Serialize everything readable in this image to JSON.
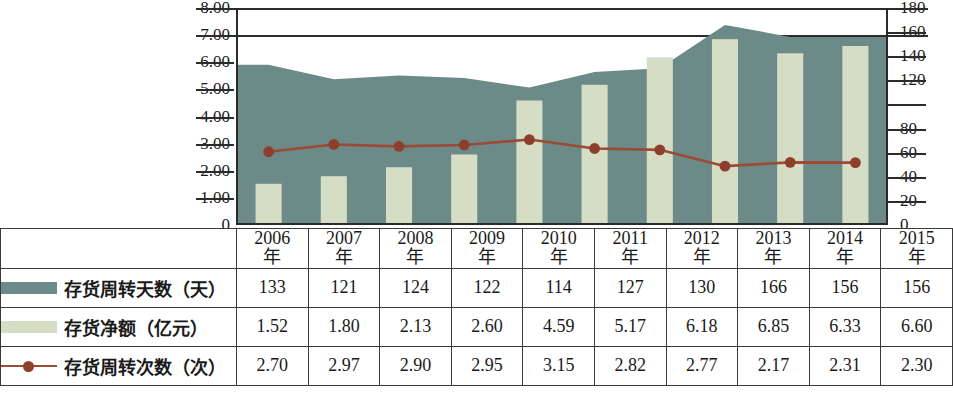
{
  "chart_data": {
    "type": "bar",
    "title": "",
    "subtitle": "",
    "xlabel": "",
    "ylabel": "",
    "grid": true,
    "legend_position": "table-left",
    "categories": [
      "2006年",
      "2007年",
      "2008年",
      "2009年",
      "2010年",
      "2011年",
      "2012年",
      "2013年",
      "2014年",
      "2015年"
    ],
    "x_tick_labels": [
      {
        "year": "2006",
        "suffix": "年"
      },
      {
        "year": "2007",
        "suffix": "年"
      },
      {
        "year": "2008",
        "suffix": "年"
      },
      {
        "year": "2009",
        "suffix": "年"
      },
      {
        "year": "2010",
        "suffix": "年"
      },
      {
        "year": "2011",
        "suffix": "年"
      },
      {
        "year": "2012",
        "suffix": "年"
      },
      {
        "year": "2013",
        "suffix": "年"
      },
      {
        "year": "2014",
        "suffix": "年"
      },
      {
        "year": "2015",
        "suffix": "年"
      }
    ],
    "left_axis": {
      "label": "",
      "ylim": [
        0,
        8
      ],
      "tick_labels": [
        "8.00",
        "7.00",
        "6.00",
        "5.00",
        "4.00",
        "3.00",
        "2.00",
        "1.00",
        "0"
      ],
      "tick_values": [
        8,
        7,
        6,
        5,
        4,
        3,
        2,
        1,
        0
      ]
    },
    "right_axis": {
      "label": "",
      "ylim": [
        0,
        180
      ],
      "tick_labels": [
        "180",
        "160",
        "140",
        "120",
        "80",
        "60",
        "40",
        "20",
        "0"
      ],
      "tick_values": [
        180,
        160,
        140,
        120,
        100,
        80,
        60,
        40,
        20,
        0
      ]
    },
    "series": [
      {
        "name": "存货周转天数（天）",
        "type": "area",
        "axis": "right",
        "unit": "天",
        "color": "#6c8a87",
        "values": [
          133,
          121,
          124,
          122,
          114,
          127,
          130,
          166,
          156,
          156
        ]
      },
      {
        "name": "存货净额（亿元）",
        "type": "bar",
        "axis": "left",
        "unit": "亿元",
        "color": "#d5ddc4",
        "values": [
          1.52,
          1.8,
          2.13,
          2.6,
          4.59,
          5.17,
          6.18,
          6.85,
          6.33,
          6.6
        ]
      },
      {
        "name": "存货周转次数（次）",
        "type": "line",
        "axis": "left",
        "unit": "次",
        "color": "#9c4a34",
        "values": [
          2.7,
          2.97,
          2.9,
          2.95,
          3.15,
          2.82,
          2.77,
          2.17,
          2.31,
          2.3
        ]
      }
    ]
  },
  "table": {
    "header_row_blank_label": "",
    "rows": [
      {
        "swatch": "area-swatch",
        "label": "存货周转天数（天）",
        "values": [
          "133",
          "121",
          "124",
          "122",
          "114",
          "127",
          "130",
          "166",
          "156",
          "156"
        ]
      },
      {
        "swatch": "bar-swatch",
        "label": "存货净额（亿元）",
        "values": [
          "1.52",
          "1.80",
          "2.13",
          "2.60",
          "4.59",
          "5.17",
          "6.18",
          "6.85",
          "6.33",
          "6.60"
        ]
      },
      {
        "swatch": "line-swatch",
        "label": "存货周转次数（次）",
        "values": [
          "2.70",
          "2.97",
          "2.90",
          "2.95",
          "3.15",
          "2.82",
          "2.77",
          "2.17",
          "2.31",
          "2.30"
        ]
      }
    ]
  },
  "colors": {
    "area": "#6c8a87",
    "bar": "#d5ddc4",
    "line": "#9c4a34",
    "marker": "#8c3f2c",
    "axis": "#2b2b2b",
    "grid": "#2b2b2b",
    "background": "#ffffff"
  }
}
